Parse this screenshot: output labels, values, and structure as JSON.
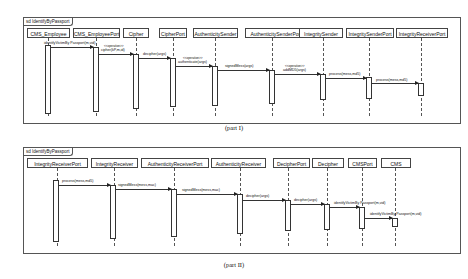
{
  "part1": {
    "frame_label": "sd IdentifyByPassport",
    "caption": "(part I)",
    "lifelines": [
      {
        "name": "CMS_Employee"
      },
      {
        "name": "CMS_EmployeePort"
      },
      {
        "name": "Cipher"
      },
      {
        "name": "CipherPort"
      },
      {
        "name": "AuthenticitySender"
      },
      {
        "name": "AuthenticitySenderPort"
      },
      {
        "name": "IntegritySender"
      },
      {
        "name": "IntegritySenderPort"
      },
      {
        "name": "IntegrityReceiverPort"
      }
    ],
    "messages": [
      {
        "from": "CMS_Employee",
        "to": "CMS_EmployeePort",
        "label": "identifyVictimBy Passport(m,vid)"
      },
      {
        "from": "CMS_EmployeePort",
        "to": "Cipher",
        "stereotype": "<<operation>>",
        "label": "cipher(kP,m,id)"
      },
      {
        "from": "Cipher",
        "to": "CipherPort",
        "label": "decipher(args)"
      },
      {
        "from": "CipherPort",
        "to": "AuthenticitySender",
        "stereotype": "<<operation>>",
        "label": "authenticate(args)"
      },
      {
        "from": "AuthenticitySender",
        "to": "AuthenticitySenderPort",
        "label": "signedMess(args)"
      },
      {
        "from": "AuthenticitySenderPort",
        "to": "IntegritySender",
        "stereotype": "<<operation>>",
        "label": "addMD5(args)"
      },
      {
        "from": "IntegritySender",
        "to": "IntegritySenderPort",
        "label": "process(mess,md5)"
      },
      {
        "from": "IntegritySenderPort",
        "to": "IntegrityReceiverPort",
        "label": "process(mess,md5)"
      }
    ]
  },
  "part2": {
    "frame_label": "sd IdentifyByPassport",
    "caption": "(part II)",
    "lifelines": [
      {
        "name": "IntegrityReceiverPort"
      },
      {
        "name": "IntegrityReceiver"
      },
      {
        "name": "AuthenticityReceiverPort"
      },
      {
        "name": "AuthenticityReceiver"
      },
      {
        "name": "DecipherPort"
      },
      {
        "name": "Decipher"
      },
      {
        "name": "CMSPort"
      },
      {
        "name": "CMS"
      }
    ],
    "messages": [
      {
        "from": "IntegrityReceiverPort",
        "to": "IntegrityReceiver",
        "label": "process(mess,md5)"
      },
      {
        "from": "IntegrityReceiver",
        "to": "AuthenticityReceiverPort",
        "label": "signedMess(mess,mac)"
      },
      {
        "from": "AuthenticityReceiverPort",
        "to": "AuthenticityReceiver",
        "label": "signedMess(mess,mac)"
      },
      {
        "from": "AuthenticityReceiver",
        "to": "DecipherPort",
        "label": "decipher(args)"
      },
      {
        "from": "DecipherPort",
        "to": "Decipher",
        "label": "decipher(args)"
      },
      {
        "from": "Decipher",
        "to": "CMSPort",
        "label": "identifyVictimBy Passport(m,vid)"
      },
      {
        "from": "CMSPort",
        "to": "CMS",
        "label": "identifyVictimBy Passport(m,vid)"
      }
    ]
  }
}
